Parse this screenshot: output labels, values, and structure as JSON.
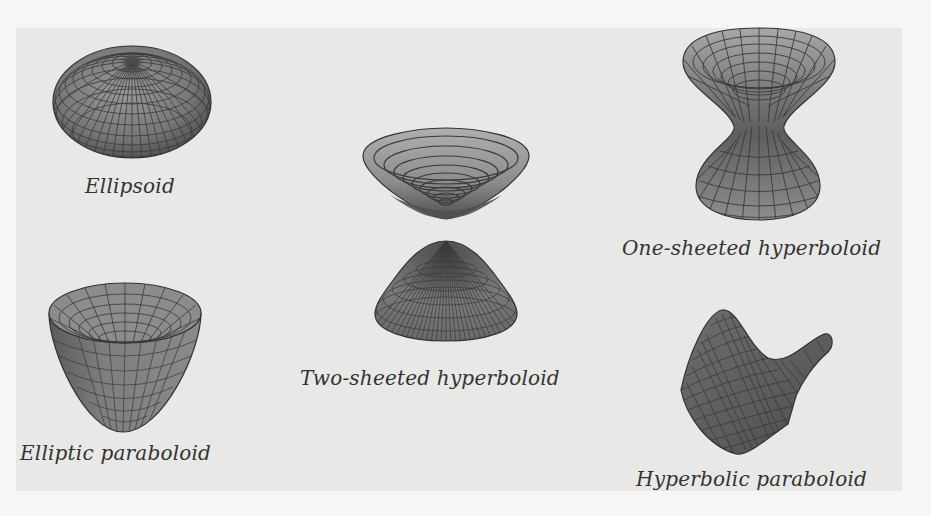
{
  "figure": {
    "background_color": "#e8e8e6",
    "page_color": "#f6f6f5",
    "surfaces": [
      {
        "id": "ellipsoid",
        "caption": "Ellipsoid"
      },
      {
        "id": "two-sheeted-hyperboloid",
        "caption": "Two-sheeted hyperboloid"
      },
      {
        "id": "one-sheeted-hyperboloid",
        "caption": "One-sheeted hyperboloid"
      },
      {
        "id": "elliptic-paraboloid",
        "caption": "Elliptic paraboloid"
      },
      {
        "id": "hyperbolic-paraboloid",
        "caption": "Hyperbolic paraboloid"
      }
    ],
    "colors": {
      "surface_fill": "#8a8a8a",
      "surface_dark": "#5a5a5a",
      "surface_light": "#b3b3b3",
      "mesh_line": "#3a3a3a"
    }
  }
}
